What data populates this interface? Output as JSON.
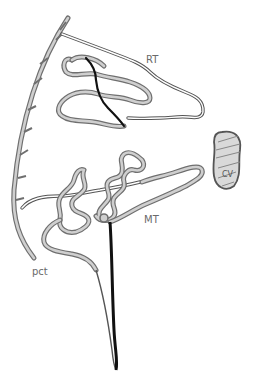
{
  "diagram": {
    "labels": {
      "rt": "RT",
      "mt": "MT",
      "cv": "CV",
      "pct": "pct"
    },
    "colors": {
      "tube_outline": "#6f6f6f",
      "tube_fill": "#cfcfcf",
      "dark_limb": "#111111",
      "vessel_fill": "#d9d9d9",
      "label_text": "#6a6a6a"
    }
  }
}
